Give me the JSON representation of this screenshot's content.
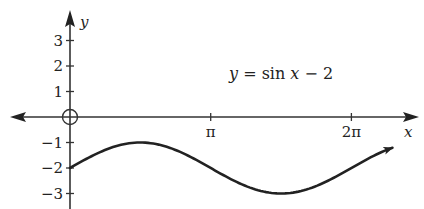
{
  "chart_data": {
    "type": "line",
    "title": "",
    "equation_label": "y = sin x − 2",
    "xlabel": "x",
    "ylabel": "y",
    "x_ticks": [
      {
        "value": 3.14159,
        "label": "π"
      },
      {
        "value": 6.28319,
        "label": "2π"
      }
    ],
    "y_ticks": [
      {
        "value": 3,
        "label": "3"
      },
      {
        "value": 2,
        "label": "2"
      },
      {
        "value": 1,
        "label": "1"
      },
      {
        "value": -1,
        "label": "−1"
      },
      {
        "value": -2,
        "label": "−2"
      },
      {
        "value": -3,
        "label": "−3"
      }
    ],
    "xlim": [
      -1.3,
      7.7
    ],
    "ylim": [
      -3.6,
      3.6
    ],
    "grid": false,
    "origin_marker": "open-circle",
    "series": [
      {
        "name": "y = sin x − 2",
        "function": "sin(x) - 2",
        "x_start": 0,
        "x_end": 7.2,
        "end_arrow": true,
        "points": [
          [
            0,
            -2
          ],
          [
            0.785,
            -1.29
          ],
          [
            1.571,
            -1
          ],
          [
            2.356,
            -1.29
          ],
          [
            3.142,
            -2
          ],
          [
            3.927,
            -2.71
          ],
          [
            4.712,
            -3
          ],
          [
            5.498,
            -2.71
          ],
          [
            6.283,
            -2
          ],
          [
            7.2,
            -1.21
          ]
        ]
      }
    ],
    "colors": {
      "line": "#222222",
      "axis": "#333333",
      "background": "#ffffff"
    }
  }
}
